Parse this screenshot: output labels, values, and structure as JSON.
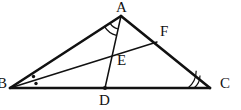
{
  "figure": {
    "kind": "euclidean-geometry-diagram",
    "background_color": "#ffffff",
    "stroke_color": "#111111",
    "label_color": "#111111",
    "points": [
      {
        "id": "A",
        "label": "A",
        "x": 121,
        "y": 16,
        "label_x": 116,
        "label_y": 0,
        "on": "apex"
      },
      {
        "id": "B",
        "label": "B",
        "x": 10,
        "y": 88,
        "label_x": -3,
        "label_y": 76,
        "on": "base-left"
      },
      {
        "id": "C",
        "label": "C",
        "x": 210,
        "y": 88,
        "label_x": 220,
        "label_y": 76,
        "on": "base-right"
      },
      {
        "id": "D",
        "label": "D",
        "x": 105,
        "y": 88,
        "label_x": 99,
        "label_y": 93,
        "on": "segment-BC"
      },
      {
        "id": "E",
        "label": "E",
        "x": 112,
        "y": 60,
        "label_x": 117,
        "label_y": 53,
        "on": "intersection-AD-BF"
      },
      {
        "id": "F",
        "label": "F",
        "x": 157,
        "y": 42,
        "label_x": 160,
        "label_y": 24,
        "on": "segment-AC"
      }
    ],
    "segments": [
      {
        "id": "AB",
        "from": "A",
        "to": "B",
        "width": 2.6,
        "role": "triangle-side"
      },
      {
        "id": "AC",
        "from": "A",
        "to": "C",
        "width": 2.6,
        "role": "triangle-side"
      },
      {
        "id": "BC",
        "from": "B",
        "to": "C",
        "width": 2.6,
        "role": "triangle-side"
      },
      {
        "id": "AD",
        "from": "A",
        "to": "D",
        "width": 1.5,
        "role": "cevian"
      },
      {
        "id": "BF",
        "from": "B",
        "to": "F",
        "width": 1.5,
        "role": "cevian"
      }
    ],
    "angle_marks": [
      {
        "id": "angle-A-double-arc",
        "at": "A",
        "style": "double-arc",
        "count": 2,
        "between": "AB and AD"
      },
      {
        "id": "angle-C-double-arc",
        "at": "C",
        "style": "double-arc",
        "count": 2,
        "between": "CB and CA"
      },
      {
        "id": "angle-B-dots",
        "at": "B",
        "style": "dot",
        "count": 2,
        "between": "BA,BF and BF,BC"
      }
    ]
  }
}
